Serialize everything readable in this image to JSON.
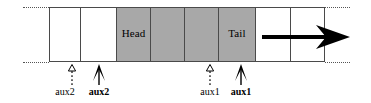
{
  "figure": {
    "type": "array-buffer-diagram",
    "colors": {
      "cell_fill_white": "#ffffff",
      "cell_fill_gray": "#a8a8a8",
      "stroke": "#4a4a4a",
      "arrow": "#000000",
      "background": "#ffffff"
    }
  },
  "strip": {
    "cells": [
      {
        "label": "",
        "fill": "white"
      },
      {
        "label": "",
        "fill": "white"
      },
      {
        "label": "Head",
        "fill": "gray"
      },
      {
        "label": "",
        "fill": "gray"
      },
      {
        "label": "",
        "fill": "gray"
      },
      {
        "label": "Tail",
        "fill": "gray"
      },
      {
        "label": "",
        "fill": "white"
      },
      {
        "label": "",
        "fill": "white"
      }
    ]
  },
  "markers": [
    {
      "id": "aux2-old",
      "label": "aux2",
      "style": "dotted",
      "bold": false
    },
    {
      "id": "aux2-new",
      "label": "aux2",
      "style": "solid",
      "bold": true
    },
    {
      "id": "aux1-old",
      "label": "aux1",
      "style": "dotted",
      "bold": false
    },
    {
      "id": "aux1-new",
      "label": "aux1",
      "style": "solid",
      "bold": true
    }
  ],
  "big_arrow": {
    "name": "direction-arrow",
    "direction": "right"
  }
}
